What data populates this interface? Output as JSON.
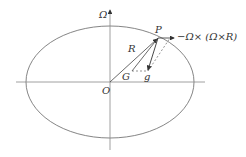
{
  "diagram": {
    "type": "ellipse-vector-diagram",
    "labels": {
      "axis_omega": "Ω",
      "point_p": "P",
      "vector_r": "R",
      "point_g": "G",
      "vector_g": "g",
      "origin": "O",
      "centrifugal": "−Ω× (Ω×R)"
    },
    "colors": {
      "stroke": "#555555",
      "axis": "#888888",
      "text": "#333333"
    }
  }
}
